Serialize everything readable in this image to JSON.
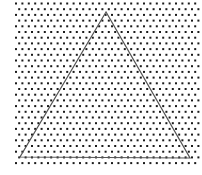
{
  "diagram": {
    "type": "dot-grid-triangle",
    "grid": {
      "pattern": "staggered",
      "dot_color": "#1a1a1a",
      "background_color": "#ffffff"
    },
    "triangle": {
      "shape": "triangle",
      "stroke_color": "#555555",
      "fill": "none",
      "vertices": [
        "apex-top",
        "bottom-left",
        "bottom-right"
      ]
    }
  }
}
